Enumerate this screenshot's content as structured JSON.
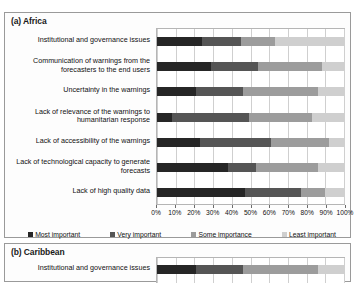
{
  "chart_data": {
    "type": "bar",
    "title": "",
    "orientation": "horizontal",
    "stacked": true,
    "stack_total": 100,
    "xlabel": "",
    "ylabel": "",
    "xlim": [
      0,
      100
    ],
    "grid": true,
    "legend_position": "bottom",
    "xticks": [
      "0%",
      "10%",
      "20%",
      "30%",
      "40%",
      "50%",
      "60%",
      "70%",
      "80%",
      "90%",
      "100%"
    ],
    "xtick_values": [
      0,
      10,
      20,
      30,
      40,
      50,
      60,
      70,
      80,
      90,
      100
    ],
    "legend": [
      {
        "label": "Most important",
        "color": "#262626"
      },
      {
        "label": "Very important",
        "color": "#555555"
      },
      {
        "label": "Some importance",
        "color": "#9c9c9c"
      },
      {
        "label": "Least important",
        "color": "#cfcfcf"
      }
    ],
    "panels": [
      {
        "id": "a",
        "title": "(a) Africa",
        "categories": [
          "Institutional and governance issues",
          "Communication of warnings from the forecasters to the end users",
          "Uncertainty in the warnings",
          "Lack of relevance of the warnings to humanitarian response",
          "Lack of accessibility of the warnings",
          "Lack of technological capacity to generate forecasts",
          "Lack of high quality data"
        ],
        "series": [
          {
            "name": "Most important",
            "values": [
              24,
              29,
              21,
              8,
              23,
              38,
              47
            ]
          },
          {
            "name": "Very important",
            "values": [
              21,
              25,
              25,
              41,
              38,
              15,
              30
            ]
          },
          {
            "name": "Some importance",
            "values": [
              18,
              34,
              40,
              34,
              31,
              33,
              13
            ]
          },
          {
            "name": "Least important",
            "values": [
              37,
              12,
              14,
              17,
              8,
              14,
              10
            ]
          }
        ]
      },
      {
        "id": "b",
        "title": "(b) Caribbean",
        "categories": [
          "Institutional and governance issues"
        ],
        "series": [
          {
            "name": "Most important",
            "values": [
              21
            ]
          },
          {
            "name": "Very important",
            "values": [
              25
            ]
          },
          {
            "name": "Some importance",
            "values": [
              40
            ]
          },
          {
            "name": "Least important",
            "values": [
              14
            ]
          }
        ]
      }
    ]
  }
}
